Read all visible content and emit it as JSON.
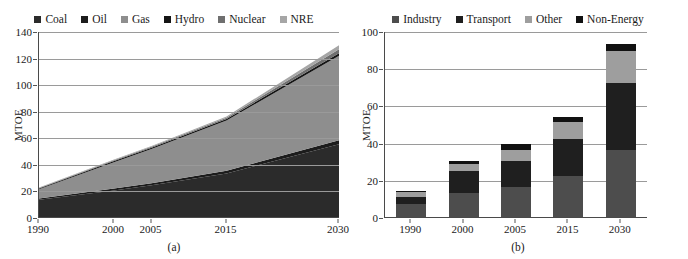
{
  "figure": {
    "panel_a": {
      "caption": "(a)",
      "legend": [
        {
          "label": "Coal",
          "color": "#2b2b2b"
        },
        {
          "label": "Oil",
          "color": "#1c1c1c"
        },
        {
          "label": "Gas",
          "color": "#8e8e8e"
        },
        {
          "label": "Hydro",
          "color": "#151515"
        },
        {
          "label": "Nuclear",
          "color": "#6f6f6f"
        },
        {
          "label": "NRE",
          "color": "#a6a6a6"
        }
      ],
      "ylabel": "MTOE",
      "yticks": [
        "0",
        "20",
        "40",
        "60",
        "80",
        "100",
        "120",
        "140"
      ],
      "xticks": [
        "1990",
        "2000",
        "2005",
        "2015",
        "2030"
      ]
    },
    "panel_b": {
      "caption": "(b)",
      "legend": [
        {
          "label": "Industry",
          "color": "#4d4d4d"
        },
        {
          "label": "Transport",
          "color": "#1f1f1f"
        },
        {
          "label": "Other",
          "color": "#9e9e9e"
        },
        {
          "label": "Non-Energy",
          "color": "#111111"
        }
      ],
      "ylabel": "MTOE",
      "yticks": [
        "0",
        "20",
        "40",
        "60",
        "80",
        "100"
      ],
      "xticks": [
        "1990",
        "2000",
        "2005",
        "2015",
        "2030"
      ]
    }
  },
  "chart_data": [
    {
      "type": "area",
      "panel": "(a)",
      "title": "",
      "xlabel": "",
      "ylabel": "MTOE",
      "x": [
        "1990",
        "2000",
        "2005",
        "2015",
        "2030"
      ],
      "xpos": [
        1990,
        2000,
        2005,
        2015,
        2030
      ],
      "ylim": [
        0,
        140
      ],
      "ytick_step": 20,
      "grid": true,
      "legend_position": "top-center",
      "stacked": true,
      "series": [
        {
          "name": "Coal",
          "color": "#2b2b2b",
          "values": [
            13,
            20,
            24,
            33,
            55
          ]
        },
        {
          "name": "Oil",
          "color": "#1c1c1c",
          "values": [
            1,
            1.5,
            1.5,
            2,
            3
          ]
        },
        {
          "name": "Gas",
          "color": "#8e8e8e",
          "values": [
            7,
            20,
            26,
            38,
            64
          ]
        },
        {
          "name": "Hydro",
          "color": "#151515",
          "values": [
            0.6,
            0.8,
            0.9,
            1.2,
            2
          ]
        },
        {
          "name": "Nuclear",
          "color": "#6f6f6f",
          "values": [
            0.4,
            0.7,
            0.8,
            1,
            3
          ]
        },
        {
          "name": "NRE",
          "color": "#a6a6a6",
          "values": [
            0.3,
            0.5,
            0.6,
            0.8,
            3
          ]
        }
      ],
      "totals": [
        22,
        43.5,
        53.8,
        76,
        130
      ]
    },
    {
      "type": "bar",
      "panel": "(b)",
      "title": "",
      "xlabel": "",
      "ylabel": "MTOE",
      "categories": [
        "1990",
        "2000",
        "2005",
        "2015",
        "2030"
      ],
      "ylim": [
        0,
        100
      ],
      "ytick_step": 20,
      "grid": true,
      "legend_position": "top-center",
      "stacked": true,
      "series": [
        {
          "name": "Industry",
          "color": "#4d4d4d",
          "values": [
            7,
            13,
            16,
            22,
            36
          ]
        },
        {
          "name": "Transport",
          "color": "#1f1f1f",
          "values": [
            4,
            12,
            14,
            20,
            36
          ]
        },
        {
          "name": "Other",
          "color": "#9e9e9e",
          "values": [
            2.5,
            3.5,
            6,
            9,
            17
          ]
        },
        {
          "name": "Non-Energy",
          "color": "#111111",
          "values": [
            0.5,
            1.5,
            3,
            3,
            4
          ]
        }
      ],
      "totals": [
        14,
        30,
        39,
        54,
        93
      ]
    }
  ]
}
